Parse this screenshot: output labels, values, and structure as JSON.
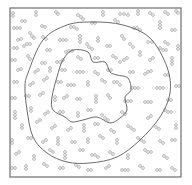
{
  "chart_data": {
    "type": "scatter",
    "title": "",
    "xlabel": "",
    "ylabel": "",
    "frame": {
      "x": 10,
      "y": 8,
      "width": 171,
      "height": 169
    },
    "colors": {
      "frame": "#6e6e6e",
      "contour": "#5a5a5a",
      "marker": "#7a7a7a",
      "background": "#ffffff"
    },
    "marker_radius": 1.4,
    "contours": [
      {
        "name": "outer-contour",
        "points": [
          [
            28,
            73
          ],
          [
            43,
            40
          ],
          [
            67,
            25
          ],
          [
            93,
            22
          ],
          [
            123,
            25
          ],
          [
            150,
            38
          ],
          [
            167,
            67
          ],
          [
            170,
            93
          ],
          [
            160,
            117
          ],
          [
            140,
            140
          ],
          [
            117,
            157
          ],
          [
            90,
            163
          ],
          [
            67,
            162
          ],
          [
            47,
            153
          ],
          [
            33,
            137
          ],
          [
            27,
            110
          ],
          [
            25,
            87
          ]
        ]
      },
      {
        "name": "inner-contour",
        "points": [
          [
            57,
            77
          ],
          [
            63,
            60
          ],
          [
            73,
            50
          ],
          [
            88,
            52
          ],
          [
            93,
            62
          ],
          [
            105,
            62
          ],
          [
            110,
            72
          ],
          [
            117,
            75
          ],
          [
            128,
            78
          ],
          [
            131,
            90
          ],
          [
            125,
            97
          ],
          [
            127,
            110
          ],
          [
            120,
            118
          ],
          [
            110,
            123
          ],
          [
            97,
            117
          ],
          [
            83,
            120
          ],
          [
            72,
            122
          ],
          [
            65,
            117
          ],
          [
            53,
            110
          ],
          [
            52,
            97
          ]
        ]
      }
    ],
    "chains": [
      [
        [
          13,
          13
        ],
        [
          13,
          16
        ]
      ],
      [
        [
          36,
          12
        ],
        [
          36,
          15
        ]
      ],
      [
        [
          56,
          12
        ],
        [
          58,
          14
        ]
      ],
      [
        [
          78,
          15
        ],
        [
          81,
          17
        ],
        [
          83,
          19
        ]
      ],
      [
        [
          103,
          12
        ],
        [
          103,
          15
        ]
      ],
      [
        [
          120,
          14
        ],
        [
          124,
          14
        ],
        [
          128,
          15
        ]
      ],
      [
        [
          138,
          11
        ],
        [
          138,
          14
        ]
      ],
      [
        [
          150,
          13
        ],
        [
          153,
          15
        ]
      ],
      [
        [
          165,
          12
        ],
        [
          168,
          14
        ]
      ],
      [
        [
          176,
          11
        ],
        [
          178,
          13
        ]
      ],
      [
        [
          22,
          21
        ],
        [
          25,
          21
        ]
      ],
      [
        [
          14,
          28
        ],
        [
          17,
          28
        ],
        [
          20,
          28
        ]
      ],
      [
        [
          42,
          26
        ],
        [
          45,
          27
        ]
      ],
      [
        [
          71,
          27
        ],
        [
          74,
          27
        ],
        [
          77,
          29
        ]
      ],
      [
        [
          92,
          23
        ],
        [
          95,
          23
        ]
      ],
      [
        [
          115,
          20
        ],
        [
          118,
          22
        ]
      ],
      [
        [
          134,
          28
        ],
        [
          137,
          28
        ],
        [
          140,
          30
        ]
      ],
      [
        [
          160,
          22
        ],
        [
          160,
          25
        ],
        [
          160,
          28
        ]
      ],
      [
        [
          172,
          30
        ],
        [
          175,
          30
        ]
      ],
      [
        [
          30,
          33
        ],
        [
          32,
          36
        ],
        [
          34,
          38
        ]
      ],
      [
        [
          18,
          40
        ],
        [
          21,
          39
        ]
      ],
      [
        [
          43,
          37
        ],
        [
          46,
          39
        ]
      ],
      [
        [
          60,
          40
        ],
        [
          63,
          40
        ],
        [
          66,
          40
        ]
      ],
      [
        [
          80,
          36
        ],
        [
          80,
          39
        ],
        [
          80,
          42
        ]
      ],
      [
        [
          98,
          38
        ],
        [
          98,
          41
        ]
      ],
      [
        [
          122,
          36
        ],
        [
          124,
          39
        ]
      ],
      [
        [
          148,
          42
        ],
        [
          152,
          42
        ]
      ],
      [
        [
          165,
          42
        ],
        [
          168,
          44
        ]
      ],
      [
        [
          14,
          48
        ],
        [
          17,
          48
        ]
      ],
      [
        [
          24,
          46
        ],
        [
          27,
          44
        ],
        [
          30,
          44
        ]
      ],
      [
        [
          47,
          50
        ],
        [
          50,
          50
        ]
      ],
      [
        [
          66,
          52
        ],
        [
          69,
          51
        ],
        [
          72,
          51
        ]
      ],
      [
        [
          87,
          44
        ],
        [
          89,
          47
        ],
        [
          92,
          49
        ]
      ],
      [
        [
          107,
          46
        ],
        [
          110,
          46
        ]
      ],
      [
        [
          130,
          44
        ],
        [
          133,
          47
        ]
      ],
      [
        [
          140,
          52
        ],
        [
          140,
          55
        ]
      ],
      [
        [
          160,
          48
        ],
        [
          163,
          50
        ],
        [
          166,
          50
        ]
      ],
      [
        [
          178,
          46
        ],
        [
          178,
          49
        ]
      ],
      [
        [
          12,
          60
        ],
        [
          15,
          60
        ]
      ],
      [
        [
          28,
          56
        ],
        [
          30,
          59
        ]
      ],
      [
        [
          42,
          63
        ],
        [
          45,
          63
        ]
      ],
      [
        [
          57,
          62
        ],
        [
          60,
          62
        ],
        [
          63,
          60
        ]
      ],
      [
        [
          78,
          57
        ],
        [
          81,
          59
        ]
      ],
      [
        [
          95,
          58
        ],
        [
          98,
          58
        ]
      ],
      [
        [
          113,
          56
        ],
        [
          116,
          58
        ]
      ],
      [
        [
          120,
          62
        ],
        [
          124,
          60
        ],
        [
          127,
          58
        ]
      ],
      [
        [
          150,
          60
        ],
        [
          153,
          58
        ]
      ],
      [
        [
          172,
          58
        ],
        [
          172,
          61
        ],
        [
          172,
          64
        ]
      ],
      [
        [
          18,
          70
        ],
        [
          21,
          69
        ]
      ],
      [
        [
          35,
          72
        ],
        [
          38,
          70
        ]
      ],
      [
        [
          50,
          68
        ],
        [
          50,
          71
        ]
      ],
      [
        [
          62,
          70
        ],
        [
          65,
          70
        ]
      ],
      [
        [
          77,
          72
        ],
        [
          80,
          72
        ],
        [
          83,
          72
        ]
      ],
      [
        [
          95,
          72
        ],
        [
          98,
          74
        ]
      ],
      [
        [
          108,
          70
        ],
        [
          111,
          70
        ]
      ],
      [
        [
          130,
          72
        ],
        [
          133,
          72
        ]
      ],
      [
        [
          145,
          74
        ],
        [
          148,
          72
        ],
        [
          151,
          71
        ]
      ],
      [
        [
          165,
          75
        ],
        [
          168,
          75
        ]
      ],
      [
        [
          14,
          82
        ],
        [
          17,
          82
        ]
      ],
      [
        [
          30,
          85
        ],
        [
          33,
          83
        ]
      ],
      [
        [
          44,
          80
        ],
        [
          47,
          78
        ]
      ],
      [
        [
          58,
          82
        ],
        [
          61,
          82
        ]
      ],
      [
        [
          68,
          85
        ],
        [
          71,
          85
        ],
        [
          74,
          85
        ]
      ],
      [
        [
          88,
          82
        ],
        [
          88,
          85
        ]
      ],
      [
        [
          102,
          80
        ],
        [
          105,
          82
        ]
      ],
      [
        [
          114,
          82
        ],
        [
          117,
          82
        ],
        [
          120,
          85
        ]
      ],
      [
        [
          132,
          88
        ],
        [
          135,
          88
        ],
        [
          138,
          88
        ]
      ],
      [
        [
          157,
          88
        ],
        [
          160,
          88
        ],
        [
          163,
          88
        ]
      ],
      [
        [
          176,
          86
        ],
        [
          179,
          86
        ]
      ],
      [
        [
          12,
          98
        ],
        [
          15,
          98
        ]
      ],
      [
        [
          26,
          96
        ],
        [
          29,
          96
        ]
      ],
      [
        [
          40,
          95
        ],
        [
          43,
          93
        ]
      ],
      [
        [
          55,
          97
        ],
        [
          55,
          100
        ]
      ],
      [
        [
          64,
          98
        ],
        [
          67,
          96
        ]
      ],
      [
        [
          77,
          99
        ],
        [
          80,
          99
        ]
      ],
      [
        [
          96,
          96
        ],
        [
          96,
          99
        ],
        [
          96,
          102
        ]
      ],
      [
        [
          108,
          95
        ],
        [
          110,
          98
        ]
      ],
      [
        [
          125,
          101
        ],
        [
          128,
          101
        ],
        [
          131,
          101
        ]
      ],
      [
        [
          145,
          102
        ],
        [
          148,
          102
        ],
        [
          151,
          102
        ]
      ],
      [
        [
          168,
          100
        ],
        [
          171,
          100
        ]
      ],
      [
        [
          15,
          112
        ],
        [
          15,
          115
        ],
        [
          15,
          118
        ]
      ],
      [
        [
          31,
          108
        ],
        [
          31,
          111
        ]
      ],
      [
        [
          45,
          114
        ],
        [
          48,
          112
        ]
      ],
      [
        [
          60,
          112
        ],
        [
          63,
          112
        ]
      ],
      [
        [
          78,
          113
        ],
        [
          78,
          116
        ]
      ],
      [
        [
          88,
          110
        ],
        [
          91,
          110
        ]
      ],
      [
        [
          102,
          115
        ],
        [
          105,
          118
        ],
        [
          108,
          120
        ]
      ],
      [
        [
          122,
          112
        ],
        [
          125,
          114
        ]
      ],
      [
        [
          148,
          118
        ],
        [
          151,
          116
        ]
      ],
      [
        [
          165,
          110
        ],
        [
          168,
          112
        ],
        [
          171,
          112
        ]
      ],
      [
        [
          22,
          125
        ],
        [
          22,
          128
        ]
      ],
      [
        [
          37,
          122
        ],
        [
          40,
          120
        ]
      ],
      [
        [
          52,
          128
        ],
        [
          55,
          126
        ]
      ],
      [
        [
          68,
          130
        ],
        [
          71,
          128
        ]
      ],
      [
        [
          84,
          125
        ],
        [
          84,
          128
        ],
        [
          84,
          131
        ]
      ],
      [
        [
          95,
          124
        ],
        [
          98,
          124
        ]
      ],
      [
        [
          111,
          130
        ],
        [
          114,
          132
        ]
      ],
      [
        [
          128,
          126
        ],
        [
          131,
          128
        ],
        [
          134,
          130
        ]
      ],
      [
        [
          156,
          127
        ],
        [
          159,
          129
        ]
      ],
      [
        [
          176,
          125
        ],
        [
          176,
          128
        ]
      ],
      [
        [
          12,
          140
        ],
        [
          12,
          143
        ]
      ],
      [
        [
          28,
          138
        ],
        [
          31,
          138
        ]
      ],
      [
        [
          43,
          142
        ],
        [
          46,
          140
        ]
      ],
      [
        [
          58,
          138
        ],
        [
          58,
          141
        ],
        [
          58,
          144
        ]
      ],
      [
        [
          72,
          142
        ],
        [
          75,
          142
        ]
      ],
      [
        [
          88,
          139
        ],
        [
          88,
          142
        ]
      ],
      [
        [
          100,
          136
        ],
        [
          103,
          138
        ]
      ],
      [
        [
          117,
          140
        ],
        [
          117,
          143
        ]
      ],
      [
        [
          138,
          138
        ],
        [
          141,
          140
        ],
        [
          144,
          142
        ]
      ],
      [
        [
          160,
          141
        ],
        [
          163,
          143
        ]
      ],
      [
        [
          172,
          140
        ],
        [
          175,
          140
        ]
      ],
      [
        [
          16,
          154
        ],
        [
          19,
          152
        ]
      ],
      [
        [
          34,
          156
        ],
        [
          34,
          159
        ]
      ],
      [
        [
          50,
          150
        ],
        [
          53,
          152
        ]
      ],
      [
        [
          65,
          152
        ],
        [
          65,
          155
        ],
        [
          65,
          158
        ]
      ],
      [
        [
          80,
          150
        ],
        [
          83,
          150
        ]
      ],
      [
        [
          92,
          155
        ],
        [
          95,
          155
        ],
        [
          98,
          157
        ]
      ],
      [
        [
          110,
          152
        ],
        [
          113,
          154
        ]
      ],
      [
        [
          128,
          155
        ],
        [
          128,
          158
        ]
      ],
      [
        [
          145,
          150
        ],
        [
          148,
          152
        ],
        [
          151,
          152
        ]
      ],
      [
        [
          164,
          156
        ],
        [
          167,
          158
        ]
      ],
      [
        [
          12,
          168
        ],
        [
          15,
          168
        ]
      ],
      [
        [
          26,
          166
        ],
        [
          26,
          169
        ]
      ],
      [
        [
          44,
          164
        ],
        [
          47,
          166
        ]
      ],
      [
        [
          60,
          168
        ],
        [
          63,
          168
        ]
      ],
      [
        [
          76,
          165
        ],
        [
          79,
          167
        ]
      ],
      [
        [
          88,
          170
        ],
        [
          91,
          170
        ]
      ],
      [
        [
          106,
          168
        ],
        [
          109,
          166
        ]
      ],
      [
        [
          122,
          170
        ],
        [
          125,
          170
        ],
        [
          128,
          170
        ]
      ],
      [
        [
          140,
          166
        ],
        [
          143,
          168
        ]
      ],
      [
        [
          157,
          170
        ],
        [
          160,
          170
        ]
      ],
      [
        [
          172,
          168
        ],
        [
          175,
          170
        ]
      ]
    ]
  }
}
